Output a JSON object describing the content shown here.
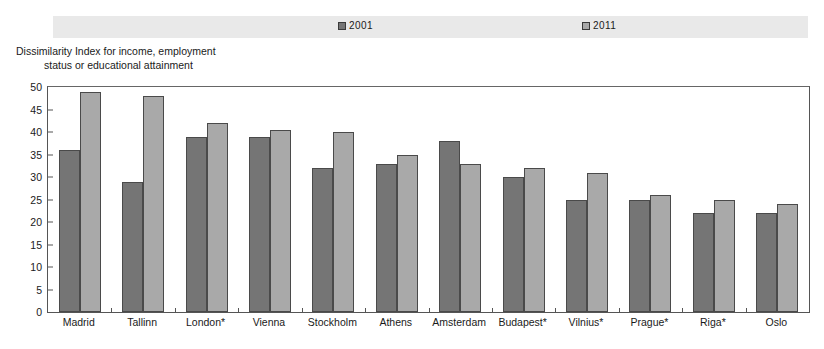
{
  "top_caption": "",
  "legend": {
    "series": [
      {
        "label": "2001",
        "color": "#757575"
      },
      {
        "label": "2011",
        "color": "#a9a9a9"
      }
    ]
  },
  "axis_title": {
    "line1": "Dissimilarity Index for income, employment",
    "line2": "status or educational attainment"
  },
  "chart_data": {
    "type": "bar",
    "title": "",
    "xlabel": "",
    "ylabel": "Dissimilarity Index for income, employment status or educational attainment",
    "ylim": [
      0,
      50
    ],
    "yticks": [
      0,
      5,
      10,
      15,
      20,
      25,
      30,
      35,
      40,
      45,
      50
    ],
    "grid": false,
    "legend_position": "top",
    "categories": [
      "Madrid",
      "Tallinn",
      "London*",
      "Vienna",
      "Stockholm",
      "Athens",
      "Amsterdam",
      "Budapest*",
      "Vilnius*",
      "Prague*",
      "Riga*",
      "Oslo"
    ],
    "series": [
      {
        "name": "2001",
        "color": "#757575",
        "values": [
          36,
          29,
          39,
          39,
          32,
          33,
          38,
          30,
          25,
          25,
          22,
          22
        ]
      },
      {
        "name": "2011",
        "color": "#a9a9a9",
        "values": [
          49,
          48,
          42,
          40.5,
          40,
          35,
          33,
          32,
          31,
          26,
          25,
          24
        ]
      }
    ]
  }
}
